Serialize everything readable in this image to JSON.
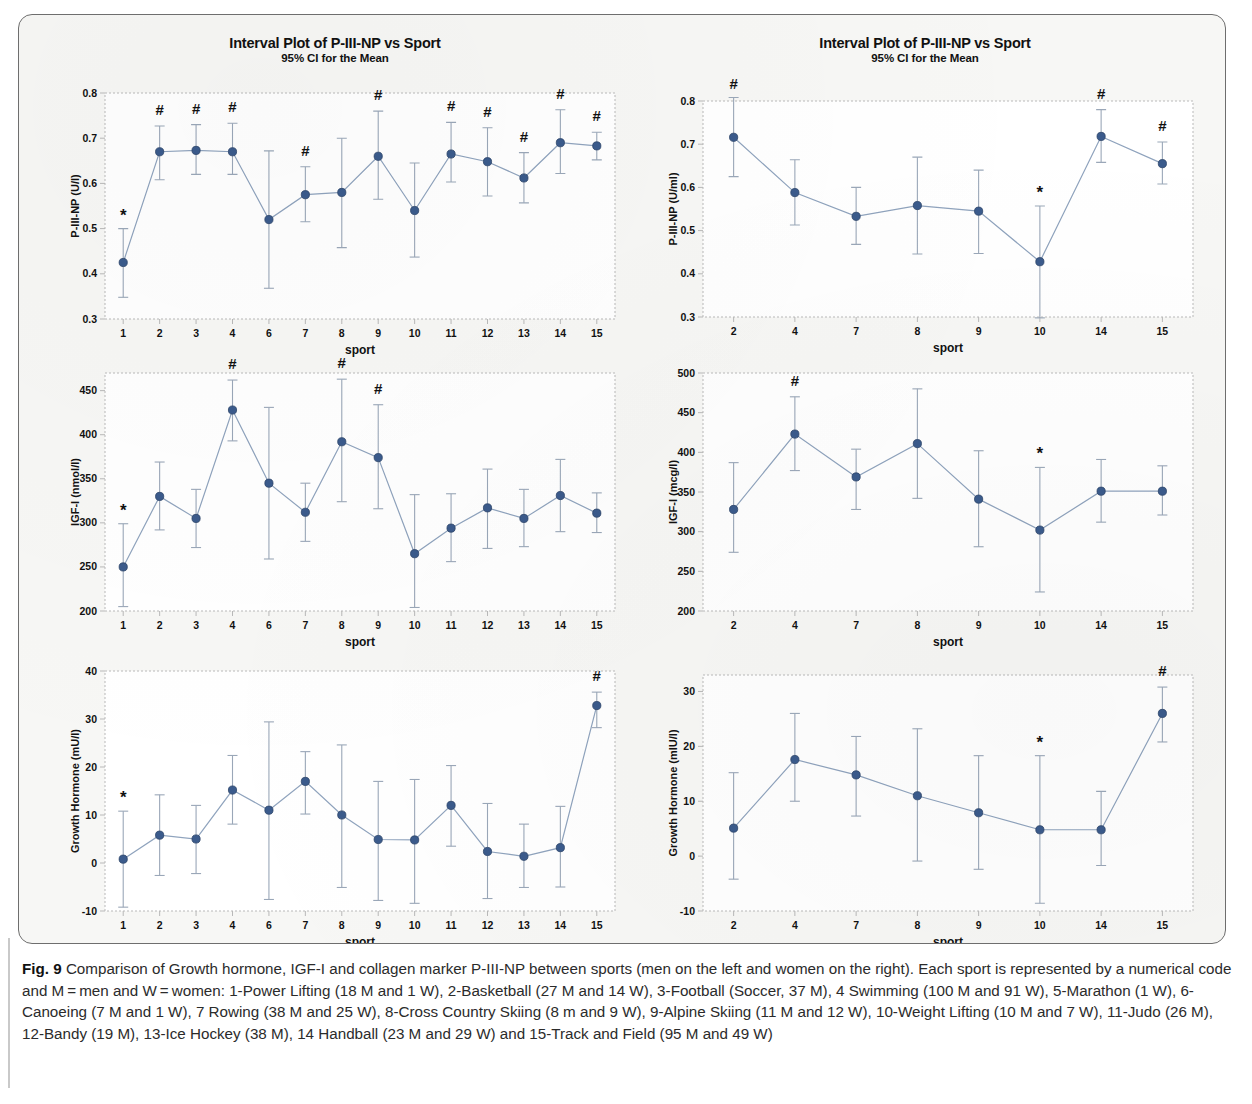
{
  "figure": {
    "caption_label": "Fig. 9",
    "caption_text": " Comparison of Growth hormone, IGF-I and collagen marker P-III-NP between sports (men on the left and women on the right). Each sport is represented by a numerical code and M = men and W = women: 1-Power Lifting (18 M and 1 W), 2-Basketball (27 M and 14 W), 3-Football (Soccer, 37 M), 4 Swimming (100 M and 91 W), 5-Marathon (1 W), 6-Canoeing (7 M and 1 W), 7 Rowing (38 M and 25 W), 8-Cross Country Skiing (8 m and 9 W), 9-Alpine Skiing (11 M and 12 W), 10-Weight Lifting (10 M and 7 W), 11-Judo (26 M), 12-Bandy (19 M), 13-Ice Hockey (38 M), 14 Handball (23 M and 29 W) and 15-Track and Field (95 M and 49 W)"
  },
  "style": {
    "marker_color": "#3b5b8c",
    "line_color": "#8fa3bd",
    "error_bar_color": "#9aa7b8",
    "axis_color": "#b9b9b9",
    "text_color": "#111111",
    "panel_bg": "#f7f7f5",
    "plot_bg": "#ffffff"
  },
  "chart_data": [
    {
      "id": "piiinp-men",
      "position": "top-left",
      "type": "scatter",
      "title": "Interval Plot of P-III-NP vs Sport",
      "subtitle": "95% CI for the Mean",
      "xlabel": "sport",
      "ylabel": "P-III-NP (U/l)",
      "ylim": [
        0.3,
        0.8
      ],
      "yticks": [
        "0.3",
        "0.4",
        "0.5",
        "0.6",
        "0.7",
        "0.8"
      ],
      "ytick_values": [
        0.3,
        0.4,
        0.5,
        0.6,
        0.7,
        0.8
      ],
      "grid": false,
      "categories": [
        "1",
        "2",
        "3",
        "4",
        "6",
        "7",
        "8",
        "9",
        "10",
        "11",
        "12",
        "13",
        "14",
        "15"
      ],
      "values": [
        0.425,
        0.67,
        0.673,
        0.67,
        0.52,
        0.575,
        0.58,
        0.66,
        0.54,
        0.665,
        0.648,
        0.612,
        0.69,
        0.683
      ],
      "ci_low": [
        0.348,
        0.608,
        0.62,
        0.62,
        0.368,
        0.515,
        0.458,
        0.565,
        0.437,
        0.603,
        0.572,
        0.557,
        0.622,
        0.652
      ],
      "ci_high": [
        0.5,
        0.727,
        0.73,
        0.733,
        0.672,
        0.637,
        0.7,
        0.76,
        0.645,
        0.735,
        0.723,
        0.668,
        0.763,
        0.713
      ],
      "annotations": [
        "*",
        "#",
        "#",
        "#",
        "",
        "#",
        "",
        "#",
        "",
        "#",
        "#",
        "#",
        "#",
        "#"
      ]
    },
    {
      "id": "piiinp-women",
      "position": "top-right",
      "type": "scatter",
      "title": "Interval Plot of P-III-NP vs Sport",
      "subtitle": "95% CI for the Mean",
      "xlabel": "sport",
      "ylabel": "P-III-NP (U/ml)",
      "ylim": [
        0.3,
        0.8
      ],
      "yticks": [
        "0.3",
        "0.4",
        "0.5",
        "0.6",
        "0.7",
        "0.8"
      ],
      "ytick_values": [
        0.3,
        0.4,
        0.5,
        0.6,
        0.7,
        0.8
      ],
      "grid": false,
      "categories": [
        "2",
        "4",
        "7",
        "8",
        "9",
        "10",
        "14",
        "15"
      ],
      "values": [
        0.716,
        0.588,
        0.533,
        0.558,
        0.545,
        0.428,
        0.718,
        0.655
      ],
      "ci_low": [
        0.625,
        0.513,
        0.468,
        0.446,
        0.447,
        0.298,
        0.658,
        0.608
      ],
      "ci_high": [
        0.808,
        0.664,
        0.6,
        0.67,
        0.64,
        0.557,
        0.78,
        0.705
      ],
      "annotations": [
        "#",
        "",
        "",
        "",
        "",
        "*",
        "#",
        "#"
      ]
    },
    {
      "id": "igf1-men",
      "position": "middle-left",
      "type": "scatter",
      "title": "",
      "subtitle": "",
      "xlabel": "sport",
      "ylabel": "IGF-I (nmol/l)",
      "ylim": [
        200,
        470
      ],
      "yticks": [
        "200",
        "250",
        "300",
        "350",
        "400",
        "450"
      ],
      "ytick_values": [
        200,
        250,
        300,
        350,
        400,
        450
      ],
      "grid": false,
      "categories": [
        "1",
        "2",
        "3",
        "4",
        "6",
        "7",
        "8",
        "9",
        "10",
        "11",
        "12",
        "13",
        "14",
        "15"
      ],
      "values": [
        250,
        330,
        305,
        428,
        345,
        312,
        392,
        374,
        265,
        294,
        317,
        305,
        331,
        311
      ],
      "ci_low": [
        205,
        292,
        272,
        393,
        259,
        279,
        324,
        316,
        204,
        256,
        271,
        273,
        290,
        289
      ],
      "ci_high": [
        299,
        369,
        338,
        462,
        431,
        345,
        463,
        434,
        332,
        333,
        361,
        338,
        372,
        334
      ],
      "annotations": [
        "*",
        "",
        "",
        "#",
        "",
        "",
        "#",
        "#",
        "",
        "",
        "",
        "",
        "",
        ""
      ]
    },
    {
      "id": "igf1-women",
      "position": "middle-right",
      "type": "scatter",
      "title": "",
      "subtitle": "",
      "xlabel": "sport",
      "ylabel": "IGF-I (mcg/l)",
      "ylim": [
        200,
        500
      ],
      "yticks": [
        "200",
        "250",
        "300",
        "350",
        "400",
        "450",
        "500"
      ],
      "ytick_values": [
        200,
        250,
        300,
        350,
        400,
        450,
        500
      ],
      "grid": false,
      "categories": [
        "2",
        "4",
        "7",
        "8",
        "9",
        "10",
        "14",
        "15"
      ],
      "values": [
        328,
        423,
        369,
        411,
        341,
        302,
        351,
        351
      ],
      "ci_low": [
        274,
        377,
        328,
        342,
        281,
        224,
        312,
        321
      ],
      "ci_high": [
        387,
        470,
        404,
        480,
        402,
        381,
        391,
        383
      ],
      "annotations": [
        "",
        "#",
        "",
        "",
        "",
        "*",
        "",
        ""
      ]
    },
    {
      "id": "gh-men",
      "position": "bottom-left",
      "type": "scatter",
      "title": "",
      "subtitle": "",
      "xlabel": "sport",
      "ylabel": "Growth Hormone (mU/l)",
      "ylim": [
        -10,
        40
      ],
      "yticks": [
        "-10",
        "0",
        "10",
        "20",
        "30",
        "40"
      ],
      "ytick_values": [
        -10,
        0,
        10,
        20,
        30,
        40
      ],
      "grid": false,
      "categories": [
        "1",
        "2",
        "3",
        "4",
        "6",
        "7",
        "8",
        "9",
        "10",
        "11",
        "12",
        "13",
        "14",
        "15"
      ],
      "values": [
        0.8,
        5.8,
        5.0,
        15.2,
        11.0,
        17.0,
        10.0,
        4.9,
        4.8,
        12.0,
        2.4,
        1.4,
        3.2,
        32.8
      ],
      "ci_low": [
        -9.2,
        -2.6,
        -2.2,
        8.1,
        -7.6,
        10.2,
        -5.1,
        -7.8,
        -8.4,
        3.5,
        -7.4,
        -5.1,
        -5.0,
        28.2
      ],
      "ci_high": [
        10.8,
        14.2,
        12.0,
        22.4,
        29.4,
        23.2,
        24.6,
        17.0,
        17.4,
        20.3,
        12.4,
        8.1,
        11.8,
        35.6
      ],
      "annotations": [
        "*",
        "",
        "",
        "",
        "",
        "",
        "",
        "",
        "",
        "",
        "",
        "",
        "",
        "#"
      ]
    },
    {
      "id": "gh-women",
      "position": "bottom-right",
      "type": "scatter",
      "title": "",
      "subtitle": "",
      "xlabel": "sport",
      "ylabel": "Growth Hormone (mIU/l)",
      "ylim": [
        -10,
        33
      ],
      "yticks": [
        "-10",
        "0",
        "10",
        "20",
        "30"
      ],
      "ytick_values": [
        -10,
        0,
        10,
        20,
        30
      ],
      "grid": false,
      "categories": [
        "2",
        "4",
        "7",
        "8",
        "9",
        "10",
        "14",
        "15"
      ],
      "values": [
        5.1,
        17.6,
        14.8,
        11.0,
        7.9,
        4.8,
        4.8,
        26.0
      ],
      "ci_low": [
        -4.2,
        10.0,
        7.3,
        -0.9,
        -2.4,
        -8.6,
        -1.7,
        20.8
      ],
      "ci_high": [
        15.2,
        26.0,
        21.8,
        23.2,
        18.3,
        18.3,
        11.8,
        30.8
      ],
      "annotations": [
        "",
        "",
        "",
        "",
        "",
        "*",
        "",
        "#"
      ]
    }
  ]
}
